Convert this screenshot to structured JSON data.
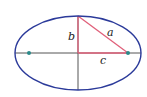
{
  "diagram": {
    "labels": {
      "a": "a",
      "b": "b",
      "c": "c"
    },
    "ellipse": {
      "cx": 78,
      "cy": 53,
      "rx": 63,
      "ry": 37,
      "stroke": "#2b3a9a"
    },
    "axes_color": "#555555",
    "triangle_color": "#e0607a",
    "focus_color": "#2a8a8a",
    "foci": [
      {
        "x": 29,
        "y": 53
      },
      {
        "x": 128,
        "y": 53
      }
    ]
  }
}
